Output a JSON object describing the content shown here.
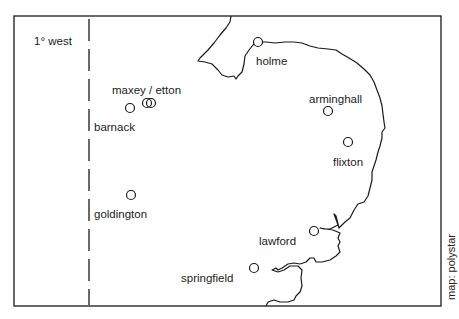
{
  "map": {
    "meridian_label": "1° west",
    "credit": "map: polystar",
    "frame": {
      "x": 14,
      "y": 16,
      "width": 427,
      "height": 290
    },
    "meridian_x": 89,
    "colors": {
      "line": "#1a1a1a",
      "background": "#ffffff",
      "text": "#222222"
    }
  },
  "sites": [
    {
      "name": "holme",
      "x": 258,
      "y": 42,
      "label_x": 257,
      "label_y": 65,
      "anchor": "start"
    },
    {
      "name": "maxey / etton",
      "x": 147,
      "y": 103,
      "label_x": 112,
      "label_y": 94,
      "anchor": "start"
    },
    {
      "name": "etton",
      "x": 151,
      "y": 103,
      "label_x": null,
      "label_y": null,
      "anchor": "start",
      "hidden_label": true
    },
    {
      "name": "barnack",
      "x": 130,
      "y": 108,
      "label_x": 94,
      "label_y": 131,
      "anchor": "start"
    },
    {
      "name": "arminghall",
      "x": 328,
      "y": 111,
      "label_x": 309,
      "label_y": 103,
      "anchor": "start"
    },
    {
      "name": "flixton",
      "x": 348,
      "y": 142,
      "label_x": 333,
      "label_y": 166,
      "anchor": "start"
    },
    {
      "name": "goldington",
      "x": 131,
      "y": 195,
      "label_x": 94,
      "label_y": 218,
      "anchor": "start"
    },
    {
      "name": "lawford",
      "x": 314,
      "y": 231,
      "label_x": 259,
      "label_y": 245,
      "anchor": "start"
    },
    {
      "name": "springfield",
      "x": 254,
      "y": 268,
      "label_x": 181,
      "label_y": 282,
      "anchor": "start"
    }
  ]
}
